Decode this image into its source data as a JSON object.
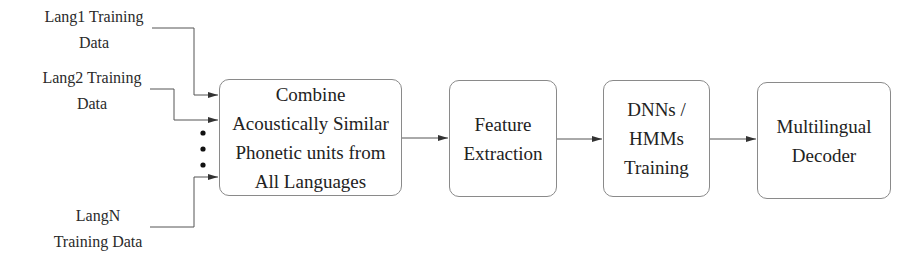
{
  "inputs": [
    {
      "label": "Lang1 Training\nData"
    },
    {
      "label": "Lang2 Training\nData"
    },
    {
      "label": "LangN\nTraining Data"
    }
  ],
  "ellipsis": "vertical-dots",
  "blocks": [
    {
      "id": "combine",
      "label": "Combine\nAcoustically Similar\nPhonetic units from\nAll Languages"
    },
    {
      "id": "feature",
      "label": "Feature\nExtraction"
    },
    {
      "id": "training",
      "label": "DNNs /\nHMMs\nTraining"
    },
    {
      "id": "decoder",
      "label": "Multilingual\nDecoder"
    }
  ],
  "colors": {
    "line": "#444444",
    "box_border": "#8a8a8a",
    "text": "#222222"
  }
}
